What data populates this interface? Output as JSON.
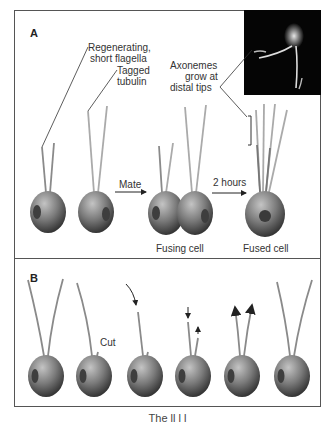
{
  "panel_a": {
    "label": "A",
    "labels": {
      "regenerating_line1": "Regenerating,",
      "regenerating_line2": "short flagella",
      "tagged_line1": "Tagged",
      "tagged_line2": "tubulin",
      "axonemes_line1": "Axonemes",
      "axonemes_line2": "grow at",
      "axonemes_line3": "distal tips",
      "mate": "Mate",
      "two_hours": "2 hours",
      "fusing_cell": "Fusing cell",
      "fused_cell": "Fused cell"
    }
  },
  "panel_b": {
    "label": "B",
    "labels": {
      "cut": "Cut"
    }
  },
  "caption": "The ll          l     l",
  "colors": {
    "frame": "#555555",
    "cell_light": "#b8b8b8",
    "cell_dark": "#3a3a3a",
    "flagella": "#8a8a8a",
    "photo_bg": "#050505"
  }
}
